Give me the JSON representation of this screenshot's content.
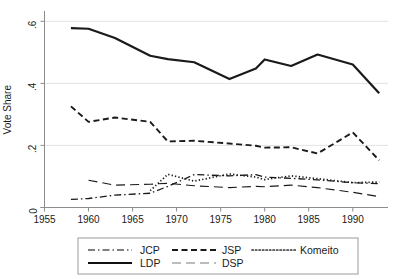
{
  "chart_data": {
    "type": "line",
    "title": "",
    "subtitle": "",
    "xlabel": "",
    "ylabel": "Vote Share",
    "xlim": [
      1955,
      1994
    ],
    "ylim": [
      0,
      0.63
    ],
    "xticks": [
      1955,
      1960,
      1965,
      1970,
      1975,
      1980,
      1985,
      1990
    ],
    "xtick_labels": [
      "1955",
      "1960",
      "1965",
      "1970",
      "1975",
      "1980",
      "1985",
      "1990"
    ],
    "yticks": [
      0,
      0.2,
      0.4,
      0.6
    ],
    "ytick_labels": [
      "0",
      ".2",
      ".4",
      ".6"
    ],
    "grid": "horizontal",
    "legend_position": "bottom",
    "series": [
      {
        "name": "JCP",
        "dash": "dash-dot",
        "color": "#555555",
        "x": [
          1958,
          1960,
          1963,
          1967,
          1969,
          1972,
          1976,
          1979,
          1980,
          1983,
          1986,
          1990,
          1993
        ],
        "values": [
          0.026,
          0.029,
          0.04,
          0.046,
          0.068,
          0.106,
          0.102,
          0.106,
          0.098,
          0.094,
          0.089,
          0.08,
          0.077
        ]
      },
      {
        "name": "JSP",
        "dash": "dashed",
        "color": "#1a1a1a",
        "x": [
          1958,
          1960,
          1963,
          1967,
          1969,
          1972,
          1976,
          1979,
          1980,
          1983,
          1986,
          1990,
          1993
        ],
        "values": [
          0.326,
          0.276,
          0.29,
          0.276,
          0.213,
          0.215,
          0.206,
          0.199,
          0.193,
          0.194,
          0.174,
          0.242,
          0.152
        ]
      },
      {
        "name": "Komeito",
        "dash": "dotted",
        "color": "#333333",
        "x": [
          1967,
          1969,
          1972,
          1976,
          1979,
          1980,
          1983,
          1986,
          1990,
          1993
        ],
        "values": [
          0.054,
          0.107,
          0.085,
          0.108,
          0.098,
          0.09,
          0.102,
          0.093,
          0.08,
          0.082
        ]
      },
      {
        "name": "LDP",
        "dash": "solid",
        "color": "#111111",
        "x": [
          1958,
          1960,
          1963,
          1967,
          1969,
          1972,
          1976,
          1979,
          1980,
          1983,
          1986,
          1990,
          1993
        ],
        "values": [
          0.578,
          0.576,
          0.546,
          0.489,
          0.478,
          0.468,
          0.414,
          0.448,
          0.477,
          0.456,
          0.493,
          0.461,
          0.368
        ]
      },
      {
        "name": "DSP",
        "dash": "long-dash",
        "color": "#7a7a7a",
        "x": [
          1960,
          1963,
          1967,
          1969,
          1972,
          1976,
          1979,
          1980,
          1983,
          1986,
          1990,
          1993
        ],
        "values": [
          0.088,
          0.072,
          0.075,
          0.078,
          0.07,
          0.064,
          0.068,
          0.067,
          0.072,
          0.064,
          0.049,
          0.035
        ]
      }
    ]
  },
  "axis": {
    "y_title": "Vote Share"
  },
  "legend": {
    "entries": [
      {
        "label": "JCP",
        "dash": "dash-dot"
      },
      {
        "label": "JSP",
        "dash": "dashed"
      },
      {
        "label": "Komeito",
        "dash": "dotted"
      },
      {
        "label": "LDP",
        "dash": "solid"
      },
      {
        "label": "DSP",
        "dash": "long-dash"
      }
    ]
  }
}
